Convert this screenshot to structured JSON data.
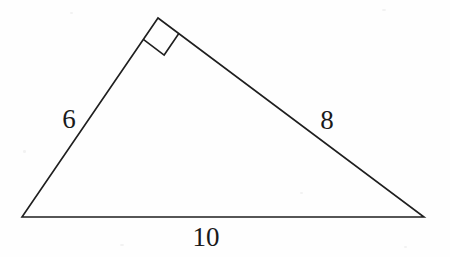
{
  "figure": {
    "kind": "right-triangle-diagram",
    "background_color": "#fefefe",
    "stroke_color": "#1f1f1f",
    "stroke_width": 1.6,
    "text_color": "#1a1a1a",
    "canvas": {
      "width": 450,
      "height": 257
    },
    "vertices": {
      "left": {
        "x": 22,
        "y": 217
      },
      "apex": {
        "x": 158,
        "y": 18
      },
      "right": {
        "x": 424,
        "y": 217
      }
    },
    "right_angle_marker": {
      "at_vertex": "apex",
      "size": 26,
      "present": true
    },
    "labels": [
      {
        "id": "left-leg",
        "text": "6",
        "x": 69,
        "y": 119
      },
      {
        "id": "right-leg",
        "text": "8",
        "x": 327,
        "y": 120
      },
      {
        "id": "base",
        "text": "10",
        "x": 206,
        "y": 237
      }
    ]
  },
  "chart_data": {
    "type": "diagram",
    "title": "",
    "shape": "right triangle",
    "sides": [
      {
        "name": "left leg",
        "label": "6",
        "value": 6
      },
      {
        "name": "right leg",
        "label": "8",
        "value": 8
      },
      {
        "name": "hypotenuse (base)",
        "label": "10",
        "value": 10
      }
    ],
    "angles": [
      {
        "vertex": "apex",
        "measure_degrees": 90,
        "marked": true
      }
    ],
    "annotations": [
      "6",
      "8",
      "10"
    ]
  }
}
